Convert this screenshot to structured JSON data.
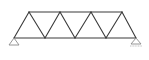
{
  "diagram": {
    "type": "warren-truss",
    "colors": {
      "background": "#ffffff",
      "member": "#3a3a3a",
      "support": "#8a8a8a",
      "ground": "#b0b0b0"
    },
    "member_width": 1.1,
    "nodes": {
      "bottom": [
        {
          "id": "B0",
          "x": 14,
          "y": 38
        },
        {
          "id": "B1",
          "x": 45,
          "y": 38
        },
        {
          "id": "B2",
          "x": 75,
          "y": 38
        },
        {
          "id": "B3",
          "x": 106,
          "y": 38
        },
        {
          "id": "B4",
          "x": 136,
          "y": 38
        }
      ],
      "top": [
        {
          "id": "T1",
          "x": 29,
          "y": 12
        },
        {
          "id": "T2",
          "x": 60,
          "y": 12
        },
        {
          "id": "T3",
          "x": 91,
          "y": 12
        },
        {
          "id": "T4",
          "x": 122,
          "y": 12
        }
      ]
    },
    "members": [
      {
        "from": "B0",
        "to": "B4",
        "kind": "bottom-chord"
      },
      {
        "from": "T1",
        "to": "T4",
        "kind": "top-chord"
      },
      {
        "from": "B0",
        "to": "T1",
        "kind": "diagonal"
      },
      {
        "from": "T1",
        "to": "B1",
        "kind": "diagonal"
      },
      {
        "from": "B1",
        "to": "T2",
        "kind": "diagonal"
      },
      {
        "from": "T2",
        "to": "B2",
        "kind": "diagonal"
      },
      {
        "from": "B2",
        "to": "T3",
        "kind": "diagonal"
      },
      {
        "from": "T3",
        "to": "B3",
        "kind": "diagonal"
      },
      {
        "from": "B3",
        "to": "T4",
        "kind": "diagonal"
      },
      {
        "from": "T4",
        "to": "B4",
        "kind": "diagonal"
      }
    ],
    "supports": [
      {
        "name": "left-pin-support",
        "node": "B0",
        "kind": "pin",
        "half_width": 5,
        "height": 7
      },
      {
        "name": "right-roller-support",
        "node": "B4",
        "kind": "roller",
        "half_width": 5,
        "height": 6
      }
    ]
  }
}
